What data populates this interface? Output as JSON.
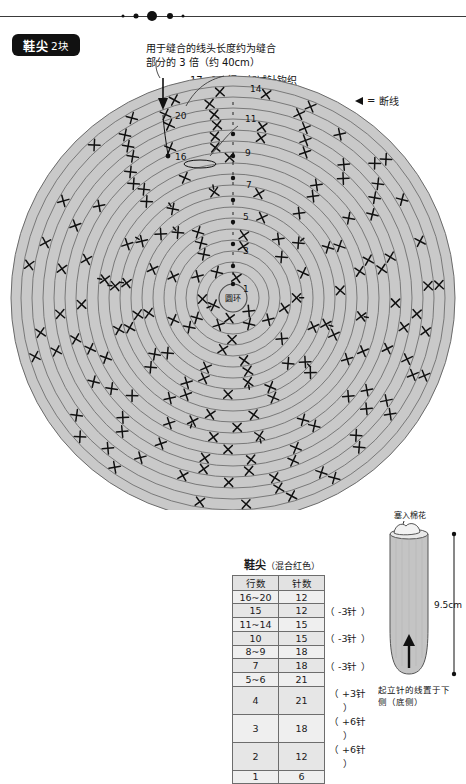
{
  "page": {
    "badge_title": "鞋尖",
    "badge_count": "2块"
  },
  "annotations": {
    "tail_length_line1": "用于缝合的线头长度约为缝合",
    "tail_length_line2": "部分的 3 倍（约 40cm）",
    "rows_17_19": "17~19 行无加减针钩织",
    "rows_12_13": "12~13 行无加减针钩织",
    "center_ring": "圆环"
  },
  "legend": {
    "symbol": "cut-thread-arrow",
    "equals": "=",
    "label": "断线"
  },
  "chart_data": {
    "type": "table",
    "title": "鞋尖（混合红色）",
    "title_main": "鞋尖",
    "title_sub": "（混合红色）",
    "columns": [
      "行数",
      "针数"
    ],
    "rows": [
      {
        "row": "16~20",
        "stitches": "12",
        "note": ""
      },
      {
        "row": "15",
        "stitches": "12",
        "note": "（ -3针 ）"
      },
      {
        "row": "11~14",
        "stitches": "15",
        "note": ""
      },
      {
        "row": "10",
        "stitches": "15",
        "note": "（ -3针 ）"
      },
      {
        "row": "8~9",
        "stitches": "18",
        "note": ""
      },
      {
        "row": "7",
        "stitches": "18",
        "note": "（ -3针 ）"
      },
      {
        "row": "5~6",
        "stitches": "21",
        "note": ""
      },
      {
        "row": "4",
        "stitches": "21",
        "note": "（ +3针 ）"
      },
      {
        "row": "3",
        "stitches": "18",
        "note": "（ +6针 ）"
      },
      {
        "row": "2",
        "stitches": "12",
        "note": "（ +6针 ）"
      },
      {
        "row": "1",
        "stitches": "6",
        "note": ""
      }
    ],
    "diagram": {
      "kind": "round-crochet-chart",
      "stitch_symbol": "x",
      "ring_count": 20,
      "row_markers": [
        "1",
        "3",
        "5",
        "7",
        "9",
        "11",
        "14",
        "16",
        "20"
      ],
      "center_label": "圆环"
    }
  },
  "illustration": {
    "stuff_label": "塞入棉花",
    "height_label": "9.5cm",
    "footer_line1": "起立针的线置于下",
    "footer_line2": "侧（底侧）",
    "arrow": "up-arrow"
  },
  "colors": {
    "fabric_fill": "#c9c9c9",
    "ring_line": "#5f5f5f",
    "stitch": "#111111",
    "badge_bg": "#111111",
    "table_border": "#6d6d6d"
  }
}
